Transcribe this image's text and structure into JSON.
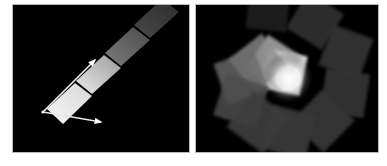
{
  "figure": {
    "background_color": "#ffffff",
    "panel_background_color": "#000000",
    "panel_border_color": "#b9b9b9",
    "width": 387,
    "height": 166
  },
  "panels": [
    {
      "id": "left",
      "name": "gradient-strip-panel",
      "description": "Diagonal strip of four shaded quadrilateral patches with two white axis arrows from a common origin",
      "x": 13,
      "y": 5,
      "width": 176,
      "height": 147,
      "axes": {
        "origin": {
          "x": 30,
          "y": 107
        },
        "arrows": [
          {
            "name": "arrow-up-right",
            "tip": {
              "x": 82,
              "y": 55
            },
            "color": "#f2f2f2",
            "width": 1.6
          },
          {
            "name": "arrow-down-right",
            "tip": {
              "x": 88,
              "y": 117
            },
            "color": "#e8e8e8",
            "width": 1.6
          }
        ]
      },
      "patches": [
        {
          "index": 0,
          "label": "patch-brightest",
          "points": "34,104 62,78 79,91 50,119",
          "fill_start": "#f7f7f7",
          "fill_end": "#d7d7d7"
        },
        {
          "index": 1,
          "label": "patch-bright",
          "points": "63,76 91,50 108,63 79,89",
          "fill_start": "#eaeaea",
          "fill_end": "#9c9c9c"
        },
        {
          "index": 2,
          "label": "patch-mid",
          "points": "92,48 120,22 137,35 108,61",
          "fill_start": "#7c7c7c",
          "fill_end": "#4b4b4b"
        },
        {
          "index": 3,
          "label": "patch-dark",
          "points": "121,20 149,-6 166,7 137,33",
          "fill_start": "#4a4a4a",
          "fill_end": "#2b2b2b"
        }
      ]
    },
    {
      "id": "right",
      "name": "radial-squares-panel",
      "description": "Spiral arrangement of rotated square tiles growing brighter toward a glowing center",
      "x": 196,
      "y": 5,
      "width": 182,
      "height": 147,
      "center": {
        "x": 92,
        "y": 73
      },
      "glow": {
        "name": "center-glow",
        "radius": 26,
        "color_core": "#ffffff",
        "color_edge": "#000000"
      },
      "squares": [
        {
          "index": 0,
          "cx": 88,
          "cy": 67,
          "size": 40,
          "rotation": 12,
          "fill": "#e9e9e9",
          "opacity": 0.95
        },
        {
          "index": 1,
          "cx": 78,
          "cy": 58,
          "size": 41,
          "rotation": 33,
          "fill": "#b8b8b8",
          "opacity": 0.8
        },
        {
          "index": 2,
          "cx": 62,
          "cy": 58,
          "size": 42,
          "rotation": 52,
          "fill": "#8d8d8d",
          "opacity": 0.78
        },
        {
          "index": 3,
          "cx": 45,
          "cy": 72,
          "size": 43,
          "rotation": 70,
          "fill": "#6a6a6a",
          "opacity": 0.8
        },
        {
          "index": 4,
          "cx": 45,
          "cy": 96,
          "size": 44,
          "rotation": 18,
          "fill": "#4e4e4e",
          "opacity": 0.85
        },
        {
          "index": 5,
          "cx": 62,
          "cy": 117,
          "size": 45,
          "rotation": 36,
          "fill": "#3f3f3f",
          "opacity": 0.9
        },
        {
          "index": 6,
          "cx": 93,
          "cy": 127,
          "size": 45,
          "rotation": 14,
          "fill": "#3a3a3a",
          "opacity": 0.92
        },
        {
          "index": 7,
          "cx": 127,
          "cy": 116,
          "size": 45,
          "rotation": 44,
          "fill": "#373737",
          "opacity": 0.92
        },
        {
          "index": 8,
          "cx": 149,
          "cy": 88,
          "size": 44,
          "rotation": 9,
          "fill": "#343434",
          "opacity": 0.92
        },
        {
          "index": 9,
          "cx": 150,
          "cy": 47,
          "size": 43,
          "rotation": 20,
          "fill": "#333333",
          "opacity": 0.92
        },
        {
          "index": 10,
          "cx": 119,
          "cy": 16,
          "size": 42,
          "rotation": 32,
          "fill": "#2f2f2f",
          "opacity": 0.92
        },
        {
          "index": 11,
          "cx": 72,
          "cy": 5,
          "size": 41,
          "rotation": 6,
          "fill": "#1f1f1f",
          "opacity": 0.88
        }
      ]
    }
  ]
}
